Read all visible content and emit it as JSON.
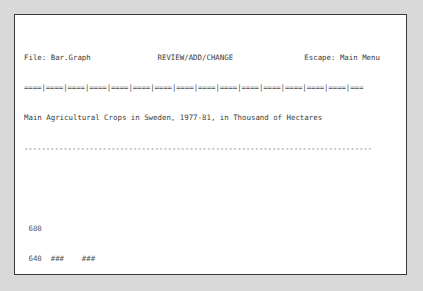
{
  "window": {
    "background": "#d9d9d9",
    "screen_background": "#ffffff",
    "border_color": "#3a3a3a",
    "text_color": "#3b3b3b"
  },
  "header": {
    "file_label": "File: Bar.Graph",
    "mode_label": "REVIEW/ADD/CHANGE",
    "escape_label": "Escape: Main Menu",
    "ruler": "====|====|====|====|====|====|====|====|====|====|====|====|====|====|====|===",
    "full_line": "File: Bar.Graph               REVIEW/ADD/CHANGE                Escape: Main Menu"
  },
  "title": {
    "text": "Main Agricultural Crops in Sweden, 1977-81, in Thousand of Hectares",
    "underline": "--------------------------------------------------------------------------------"
  },
  "chart_data": {
    "type": "bar",
    "title": "Main Agricultural Crops in Sweden, 1977-81, in Thousand of Hectares",
    "ylabel": "KHa",
    "xlabel": "Crop",
    "unit": "Thousand of Hectares",
    "categories": [
      "Hay",
      "Barley",
      "Oats",
      "Autumn Wheat",
      "Spring Rape",
      "Rye",
      "Spring Wheat",
      "Mixed Grain",
      "Autumn Rape",
      "Sugar Beet",
      "Potato"
    ],
    "category_line1": [
      "Hay",
      "Barley",
      "Oats",
      "Autumn",
      "Spring",
      "Rye",
      "Spring",
      "Mixed",
      "Autumn",
      "Sugar",
      "Potato"
    ],
    "category_line2": [
      "",
      "",
      "",
      "Wheat",
      "Rape",
      "",
      "Wheat",
      "Grain",
      "Rape",
      "Beet",
      ""
    ],
    "values": [
      664,
      661,
      459,
      221,
      99,
      73,
      62,
      57,
      55,
      52,
      43
    ],
    "bar_glyph": "###",
    "axis_break": true,
    "axis_break_note": "scale break between 440 and 240",
    "upper_ticks": [
      680,
      640,
      600,
      560,
      520,
      480,
      440
    ],
    "lower_ticks": [
      240,
      200,
      160,
      120,
      80,
      40
    ],
    "ylim": [
      0,
      680
    ],
    "grid": false,
    "legend": null,
    "rows": [
      {
        "tick": "680",
        "bars": [
          0,
          0,
          0,
          0,
          0,
          0,
          0,
          0,
          0,
          0,
          0
        ]
      },
      {
        "tick": "640",
        "bars": [
          1,
          1,
          0,
          0,
          0,
          0,
          0,
          0,
          0,
          0,
          0
        ]
      },
      {
        "tick": "600",
        "bars": [
          1,
          1,
          0,
          0,
          0,
          0,
          0,
          0,
          0,
          0,
          0
        ]
      },
      {
        "tick": "560",
        "bars": [
          1,
          1,
          0,
          0,
          0,
          0,
          0,
          0,
          0,
          0,
          0
        ]
      },
      {
        "tick": "520",
        "bars": [
          1,
          1,
          0,
          0,
          0,
          0,
          0,
          0,
          0,
          0,
          0
        ]
      },
      {
        "tick": "480",
        "bars": [
          1,
          1,
          0,
          0,
          0,
          0,
          0,
          0,
          0,
          0,
          0
        ]
      },
      {
        "tick": "440",
        "bars": [
          1,
          1,
          1,
          0,
          0,
          0,
          0,
          0,
          0,
          0,
          0
        ]
      },
      {
        "tick": "240",
        "bars": [
          1,
          1,
          1,
          0,
          0,
          0,
          0,
          0,
          0,
          0,
          0
        ]
      },
      {
        "tick": "200",
        "bars": [
          1,
          1,
          1,
          1,
          0,
          0,
          0,
          0,
          0,
          0,
          0
        ]
      },
      {
        "tick": "160",
        "bars": [
          1,
          1,
          1,
          1,
          0,
          0,
          0,
          0,
          0,
          0,
          0
        ]
      },
      {
        "tick": "120",
        "bars": [
          1,
          1,
          1,
          1,
          0,
          0,
          0,
          0,
          0,
          0,
          0
        ]
      },
      {
        "tick": "80",
        "bars": [
          1,
          1,
          1,
          1,
          1,
          0,
          0,
          0,
          0,
          0,
          0
        ]
      },
      {
        "tick": "40",
        "bars": [
          1,
          1,
          1,
          1,
          1,
          1,
          1,
          1,
          1,
          1,
          1
        ]
      }
    ]
  },
  "footer": {
    "value_row_label": "KHa",
    "category_row_label": "Crop",
    "separator": "--------------------------------------------------------------------------------"
  },
  "status": {
    "hint": "Type entry or use @ commands",
    "position": "Line 3  Column  1",
    "help": "@-? for Help",
    "line_number": "3",
    "column_number": "1",
    "separator": "--------------------------------------------------------------------------------"
  }
}
